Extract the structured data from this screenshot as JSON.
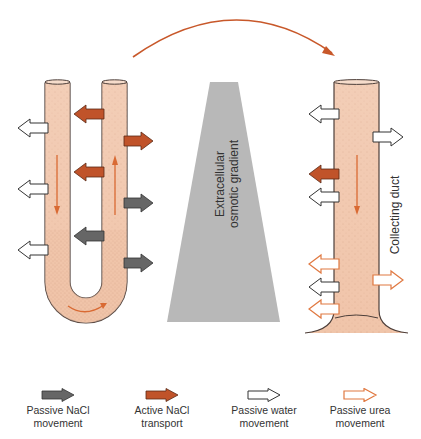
{
  "diagram": {
    "gradient_label_line1": "Extracellular",
    "gradient_label_line2": "osmotic gradient",
    "duct_label": "Collecting duct",
    "colors": {
      "tubule_fill": "#f2c9b0",
      "tubule_stroke": "#5a4a44",
      "passive_nacl": "#6b6b6b",
      "active_nacl": "#c0532a",
      "passive_water": "#ffffff",
      "passive_urea": "#e07840",
      "flow_arrow": "#d96a33",
      "gradient_fill": "#b5b5b5"
    },
    "loop_arrows": [
      {
        "side": "descending-left",
        "type": "passive-water",
        "y": 128
      },
      {
        "side": "descending-left",
        "type": "passive-water",
        "y": 189
      },
      {
        "side": "descending-left",
        "type": "passive-water",
        "y": 250
      },
      {
        "side": "gap-left",
        "type": "active-nacl",
        "y": 114
      },
      {
        "side": "gap-left",
        "type": "active-nacl",
        "y": 172
      },
      {
        "side": "gap-left",
        "type": "passive-nacl",
        "y": 236
      },
      {
        "side": "ascending-right",
        "type": "active-nacl",
        "y": 141
      },
      {
        "side": "ascending-right",
        "type": "passive-nacl",
        "y": 203
      },
      {
        "side": "ascending-right",
        "type": "passive-nacl",
        "y": 263
      }
    ],
    "duct_arrows": [
      {
        "side": "left",
        "type": "passive-water",
        "y": 114
      },
      {
        "side": "right",
        "type": "passive-water",
        "y": 137
      },
      {
        "side": "left",
        "type": "active-nacl",
        "y": 174
      },
      {
        "side": "left",
        "type": "passive-water",
        "y": 197
      },
      {
        "side": "left",
        "type": "passive-urea",
        "y": 264
      },
      {
        "side": "right",
        "type": "passive-urea",
        "y": 280
      },
      {
        "side": "left",
        "type": "passive-water",
        "y": 287
      },
      {
        "side": "left",
        "type": "passive-urea",
        "y": 309
      }
    ]
  },
  "legend": {
    "items": [
      {
        "key": "passive-nacl",
        "line1": "Passive NaCl",
        "line2": "movement"
      },
      {
        "key": "active-nacl",
        "line1": "Active NaCl",
        "line2": "transport"
      },
      {
        "key": "passive-water",
        "line1": "Passive water",
        "line2": "movement"
      },
      {
        "key": "passive-urea",
        "line1": "Passive urea",
        "line2": "movement"
      }
    ]
  }
}
